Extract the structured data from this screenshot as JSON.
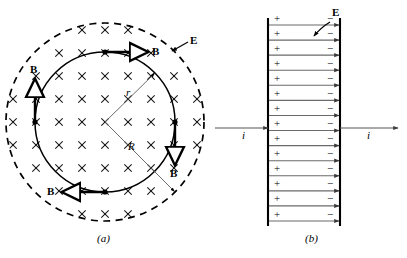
{
  "figure": {
    "caption_a": "(a)",
    "caption_b": "(b)",
    "panel_a": {
      "name": "circular-region-induced-magnetic-field",
      "field_symbol": "×",
      "field_direction": "into-page",
      "outer_circle": {
        "label": "E",
        "style": "dashed",
        "radius_px": 100,
        "meaning": "boundary of uniform electric field region"
      },
      "inner_circle": {
        "label": "r",
        "style": "solid",
        "radius_px": 70,
        "meaning": "amperian loop radius"
      },
      "radius_label_r": "r",
      "radius_label_R": "R",
      "field_label": "E",
      "b_labels": [
        "B",
        "B",
        "B",
        "B"
      ],
      "b_arrow_directions": [
        "right",
        "down",
        "left",
        "up"
      ],
      "cross_grid": {
        "columns": 9,
        "rows": 9,
        "spacing_px": 23
      }
    },
    "panel_b": {
      "name": "parallel-plate-capacitor-cross-section",
      "left_plate_sign": "+",
      "right_plate_sign": "−",
      "plate_charge_count": 14,
      "field_line_count": 14,
      "field_label": "E",
      "current_label_left": "i",
      "current_label_right": "i",
      "current_direction": "left-to-right"
    }
  },
  "colors": {
    "ink": "#000000",
    "background": "#ffffff",
    "thin_line": "#555555",
    "field_line": "#6a6a6a"
  }
}
